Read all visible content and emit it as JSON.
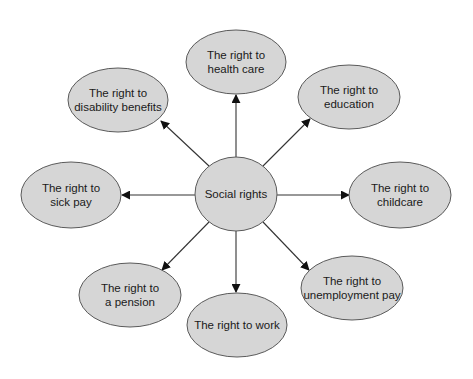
{
  "diagram": {
    "type": "hub-and-spoke concept map",
    "colors": {
      "node_fill": "#d6d6d6",
      "node_stroke": "#5a5a5a",
      "edge": "#333333",
      "text": "#1a1a1a",
      "background": "#ffffff"
    },
    "center": {
      "id": "social-rights",
      "lines": [
        "Social rights"
      ],
      "cx": 236,
      "cy": 194,
      "rx": 41,
      "ry": 37
    },
    "nodes": [
      {
        "id": "health-care",
        "lines": [
          "The right to",
          "health care"
        ],
        "cx": 236,
        "cy": 62,
        "rx": 50,
        "ry": 32
      },
      {
        "id": "education",
        "lines": [
          "The right to",
          "education"
        ],
        "cx": 349,
        "cy": 97,
        "rx": 51,
        "ry": 32
      },
      {
        "id": "childcare",
        "lines": [
          "The right to",
          "childcare"
        ],
        "cx": 400,
        "cy": 195,
        "rx": 51,
        "ry": 33
      },
      {
        "id": "unemployment-pay",
        "lines": [
          "The right to",
          "unemployment pay"
        ],
        "cx": 352,
        "cy": 288,
        "rx": 51,
        "ry": 32
      },
      {
        "id": "work",
        "lines": [
          "The right to work"
        ],
        "cx": 237,
        "cy": 325,
        "rx": 50,
        "ry": 32
      },
      {
        "id": "pension",
        "lines": [
          "The right to",
          "a pension"
        ],
        "cx": 130,
        "cy": 295,
        "rx": 51,
        "ry": 32
      },
      {
        "id": "sick-pay",
        "lines": [
          "The right to",
          "sick pay"
        ],
        "cx": 71,
        "cy": 195,
        "rx": 50,
        "ry": 33
      },
      {
        "id": "disability-benefits",
        "lines": [
          "The right to",
          "disability benefits"
        ],
        "cx": 118,
        "cy": 100,
        "rx": 50,
        "ry": 32
      }
    ],
    "edges": [
      {
        "from": "social-rights",
        "to": "health-care",
        "x1": 236,
        "y1": 157,
        "x2": 236,
        "y2": 95
      },
      {
        "from": "social-rights",
        "to": "education",
        "x1": 263,
        "y1": 166,
        "x2": 310,
        "y2": 119
      },
      {
        "from": "social-rights",
        "to": "childcare",
        "x1": 277,
        "y1": 195,
        "x2": 349,
        "y2": 195
      },
      {
        "from": "social-rights",
        "to": "unemployment-pay",
        "x1": 263,
        "y1": 222,
        "x2": 309,
        "y2": 270
      },
      {
        "from": "social-rights",
        "to": "work",
        "x1": 236,
        "y1": 231,
        "x2": 236,
        "y2": 292
      },
      {
        "from": "social-rights",
        "to": "pension",
        "x1": 209,
        "y1": 222,
        "x2": 162,
        "y2": 270
      },
      {
        "from": "social-rights",
        "to": "sick-pay",
        "x1": 195,
        "y1": 195,
        "x2": 122,
        "y2": 195
      },
      {
        "from": "social-rights",
        "to": "disability-benefits",
        "x1": 209,
        "y1": 166,
        "x2": 161,
        "y2": 121
      }
    ]
  }
}
